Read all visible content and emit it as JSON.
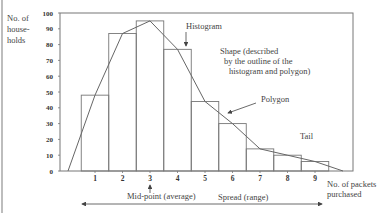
{
  "chart_data": {
    "type": "bar",
    "subtype": "histogram with frequency polygon",
    "title": "",
    "xlabel": "No. of packets purchased",
    "ylabel": "No. of house-holds",
    "ylabel_lines": [
      "No. of",
      "house-",
      "holds"
    ],
    "xlabel_lines": [
      "No.  of packets",
      "purchased"
    ],
    "categories": [
      "1",
      "2",
      "3",
      "4",
      "5",
      "6",
      "7",
      "8",
      "9"
    ],
    "values": [
      48,
      87,
      95,
      77,
      44,
      30,
      14,
      10,
      6
    ],
    "series": [
      {
        "name": "Histogram",
        "type": "bar",
        "values": [
          48,
          87,
          95,
          77,
          44,
          30,
          14,
          10,
          6
        ]
      },
      {
        "name": "Polygon",
        "type": "line",
        "x": [
          0,
          1,
          2,
          3,
          4,
          5,
          6,
          7,
          8,
          9,
          10
        ],
        "values": [
          0,
          48,
          87,
          95,
          77,
          44,
          30,
          14,
          10,
          6,
          0
        ]
      }
    ],
    "ylim": [
      0,
      100
    ],
    "yticks": [
      0,
      10,
      20,
      30,
      40,
      50,
      60,
      70,
      80,
      90,
      100
    ],
    "xticks": [
      1,
      2,
      3,
      4,
      5,
      6,
      7,
      8,
      9
    ],
    "grid": false,
    "annotations": [
      {
        "text": "Histogram",
        "points_to": "bar 4 top-right corner"
      },
      {
        "text": "Shape (described by the outline of the histogram and polygon)",
        "lines": [
          "Shape  (described",
          "by the outline of the",
          "histogram and polygon)"
        ]
      },
      {
        "text": "Polygon",
        "points_to": "polygon line near x=5.5"
      },
      {
        "text": "Tail"
      },
      {
        "text": "Mid-point (average)",
        "points_to": "x=3"
      },
      {
        "text": "Spread  (range)",
        "type": "double-arrow spanning x axis"
      }
    ]
  },
  "labels": {
    "histogram": "Histogram",
    "shape_1": "Shape  (described",
    "shape_2": "by the outline of the",
    "shape_3": "histogram and polygon)",
    "polygon": "Polygon",
    "tail": "Tail",
    "midpoint": "Mid-point (average)",
    "spread": "Spread  (range)",
    "xlabel_1": "No.  of packets",
    "xlabel_2": "purchased",
    "ylabel_1": "No. of",
    "ylabel_2": "house-",
    "ylabel_3": "holds"
  },
  "colors": {
    "line": "#666666",
    "text": "#444444",
    "left_bar": "#bdbdbd"
  }
}
